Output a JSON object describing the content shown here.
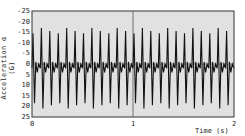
{
  "chart_data": {
    "type": "line",
    "title": "",
    "xlabel": "Time (s)",
    "ylabel": "Acceleration α (G)",
    "xlim": [
      0,
      2
    ],
    "ylim": [
      25,
      -25
    ],
    "y_inverted": true,
    "x_ticks": [
      "0",
      "1",
      "2"
    ],
    "y_ticks": [
      "-25",
      "-20",
      "-15",
      "-10",
      "-5",
      "0",
      "5",
      "10",
      "15",
      "20",
      "25"
    ],
    "grid": "dense horizontal hatching",
    "legend": null,
    "series": [
      {
        "name": "acceleration",
        "description": "periodic oscillation ~12 Hz, 24 cycles over 0–2 s",
        "frequency_hz": 12,
        "peak_negative": -16,
        "peak_positive": 20,
        "secondary_dip": 4,
        "cycles": 24
      }
    ],
    "annotations": [
      {
        "type": "vertical-line",
        "x": 1
      }
    ]
  }
}
